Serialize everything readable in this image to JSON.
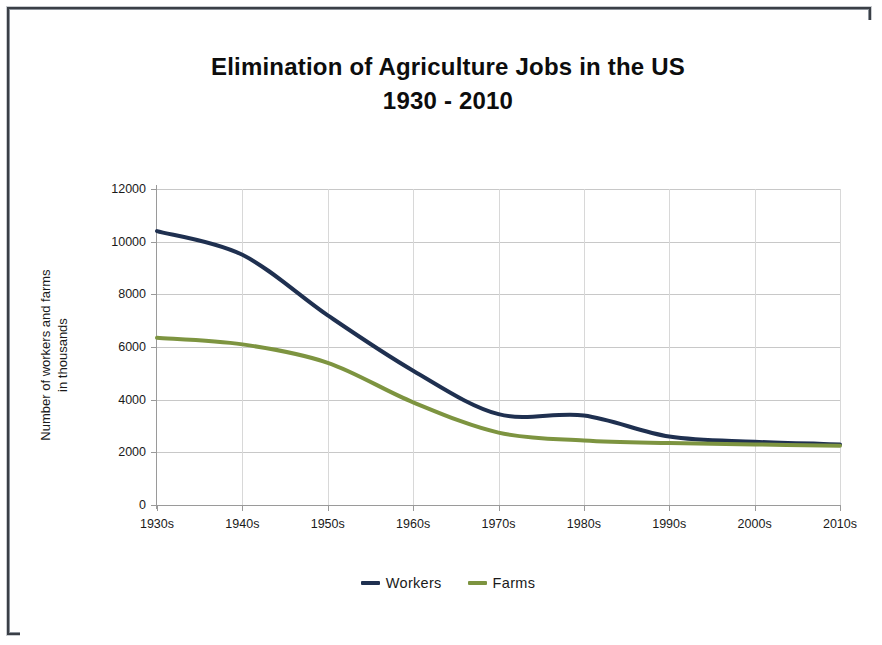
{
  "chart_data": {
    "type": "line",
    "title": "Elimination of Agriculture Jobs in the US",
    "subtitle": "1930 - 2010",
    "xlabel": "",
    "ylabel": "Number of workers and farms in thousands",
    "ylabel_line1": "Number of workers and farms",
    "ylabel_line2": "in thousands",
    "categories": [
      "1930s",
      "1940s",
      "1950s",
      "1960s",
      "1970s",
      "1980s",
      "1990s",
      "2000s",
      "2010s"
    ],
    "ylim": [
      0,
      12000
    ],
    "yticks": [
      0,
      2000,
      4000,
      6000,
      8000,
      10000,
      12000
    ],
    "ytick_labels": [
      "0",
      "2000",
      "4000",
      "6000",
      "8000",
      "10000",
      "12000"
    ],
    "grid": true,
    "legend_position": "bottom",
    "series": [
      {
        "name": "Workers",
        "color": "#1f3050",
        "values": [
          10400,
          9500,
          7200,
          5100,
          3450,
          3400,
          2600,
          2400,
          2300
        ]
      },
      {
        "name": "Farms",
        "color": "#7d9440",
        "values": [
          6350,
          6100,
          5400,
          3900,
          2750,
          2450,
          2350,
          2300,
          2250
        ]
      }
    ]
  },
  "legend": {
    "items": [
      {
        "label": "Workers"
      },
      {
        "label": "Farms"
      }
    ]
  },
  "colors": {
    "workers": "#1f3050",
    "farms": "#7d9440",
    "grid": "#c8c8c8",
    "axis": "#9a9a9a",
    "text": "#1a1a1a",
    "frame": "#3a3f46",
    "background": "#ffffff"
  }
}
